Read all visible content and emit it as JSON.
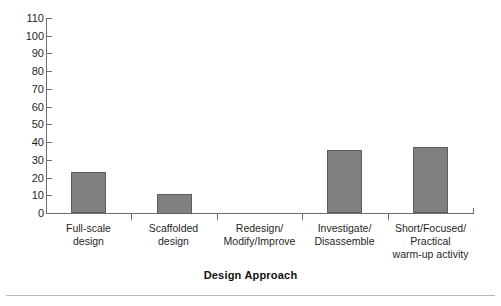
{
  "chart_data": {
    "type": "bar",
    "title": "",
    "xlabel": "Design Approach",
    "ylabel": "",
    "categories": [
      "Full-scale\ndesign",
      "Scaffolded\ndesign",
      "Redesign/\nModify/Improve",
      "Investigate/\nDisassemble",
      "Short/Focused/\nPractical\nwarm-up activity"
    ],
    "category_lines": [
      [
        "Full-scale",
        "design"
      ],
      [
        "Scaffolded",
        "design"
      ],
      [
        "Redesign/",
        "Modify/Improve"
      ],
      [
        "Investigate/",
        "Disassemble"
      ],
      [
        "Short/Focused/",
        "Practical",
        "warm-up activity"
      ]
    ],
    "values": [
      23,
      11,
      0,
      35.5,
      37.5
    ],
    "ylim": [
      0,
      110
    ],
    "ytick_step": 10,
    "ytick_labels": [
      "110",
      "100",
      "90",
      "80",
      "70",
      "60",
      "50",
      "40",
      "30",
      "20",
      "10",
      "0"
    ],
    "grid": false,
    "legend": null,
    "bar_color": "#808080",
    "bar_edge_color": "#5d5d5d",
    "axis_color": "#6e6e6e",
    "background": "#ffffff"
  }
}
